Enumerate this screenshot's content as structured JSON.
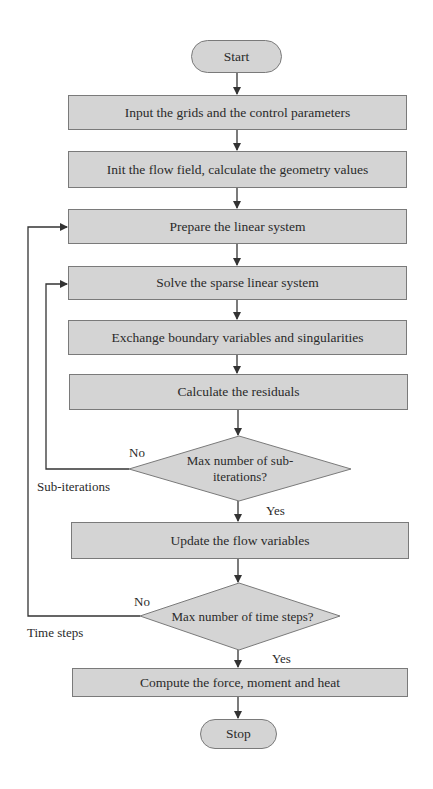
{
  "flowchart": {
    "start": "Start",
    "stop": "Stop",
    "steps": [
      "Input the grids and the control parameters",
      "Init the flow field, calculate the geometry values",
      "Prepare the linear system",
      "Solve the sparse linear system",
      "Exchange boundary variables and singularities",
      "Calculate the residuals",
      "Update the flow variables",
      "Compute the force, moment and heat"
    ],
    "decisions": [
      {
        "text": "Max number of sub-iterations?",
        "line1": "Max number of sub-",
        "line2": "iterations?",
        "yes_label": "Yes",
        "no_label": "No",
        "loop_label": "Sub-iterations"
      },
      {
        "text": "Max number of time steps?",
        "yes_label": "Yes",
        "no_label": "No",
        "loop_label": "Time steps"
      }
    ]
  },
  "colors": {
    "shape_fill": "#d4d4d4",
    "shape_border": "#7a7a7a",
    "line": "#333333",
    "background": "#ffffff"
  }
}
